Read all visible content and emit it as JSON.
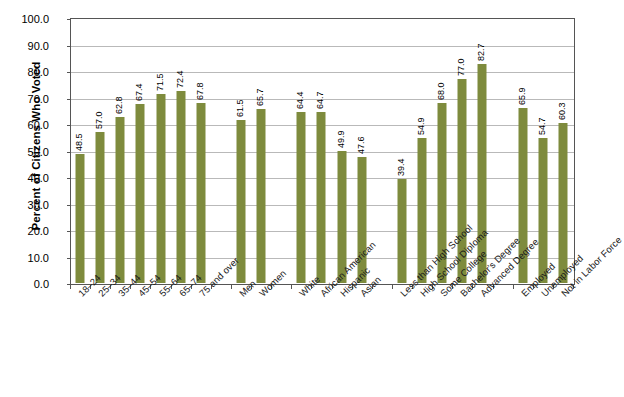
{
  "chart_data": {
    "type": "bar",
    "title": "",
    "subtitle": "",
    "xlabel": "",
    "ylabel": "Percent of Citizens Who Voted",
    "ylim": [
      0.0,
      100.0
    ],
    "ytick_step": 10.0,
    "ytick_labels": [
      "100.0",
      "90.0",
      "80.0",
      "70.0",
      "60.0",
      "50.0",
      "40.0",
      "30.0",
      "20.0",
      "10.0",
      "0.0"
    ],
    "grid": true,
    "legend": "none",
    "bar_color": "#7e8b3d",
    "categories": [
      "18–24",
      "25–34",
      "35–44",
      "45–54",
      "55–64",
      "65–74",
      "75 and over",
      "Men",
      "Women",
      "White",
      "African American",
      "Hispanic",
      "Asian",
      "Less than High School",
      "High School Diploma",
      "Some College",
      "Bachelor's Degree",
      "Advanced Degree",
      "Employed",
      "Unemployed",
      "Not in Labor Force"
    ],
    "values": [
      48.5,
      57.0,
      62.8,
      67.4,
      71.5,
      72.4,
      67.8,
      61.5,
      65.7,
      64.4,
      64.7,
      49.9,
      47.6,
      39.4,
      54.9,
      68.0,
      77.0,
      82.7,
      65.9,
      54.7,
      60.3
    ],
    "value_labels": [
      "48.5",
      "57.0",
      "62.8",
      "67.4",
      "71.5",
      "72.4",
      "67.8",
      "61.5",
      "65.7",
      "64.4",
      "64.7",
      "49.9",
      "47.6",
      "39.4",
      "54.9",
      "68.0",
      "77.0",
      "82.7",
      "65.9",
      "54.7",
      "60.3"
    ],
    "groups": [
      {
        "name": "Age",
        "categories": [
          "18–24",
          "25–34",
          "35–44",
          "45–54",
          "55–64",
          "65–74",
          "75 and over"
        ]
      },
      {
        "name": "Sex",
        "categories": [
          "Men",
          "Women"
        ]
      },
      {
        "name": "Race and Hispanic Origin",
        "categories": [
          "White",
          "African American",
          "Hispanic",
          "Asian"
        ]
      },
      {
        "name": "Educational Attainment",
        "categories": [
          "Less than High School",
          "High School Diploma",
          "Some College",
          "Bachelor's Degree",
          "Advanced Degree"
        ]
      },
      {
        "name": "Employment Status",
        "categories": [
          "Employed",
          "Unemployed",
          "Not in Labor Force"
        ]
      }
    ],
    "slot_indices": [
      0,
      1,
      2,
      3,
      4,
      5,
      6,
      8,
      9,
      11,
      12,
      13,
      14,
      16,
      17,
      18,
      19,
      20,
      22,
      23,
      24
    ],
    "total_slots": 25
  }
}
